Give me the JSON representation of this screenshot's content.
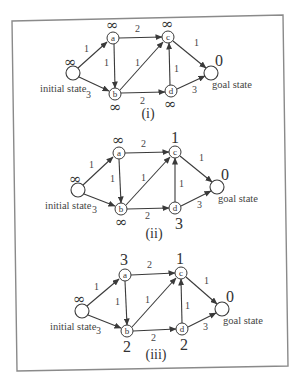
{
  "figure": {
    "labels": {
      "initial_state": "initial state",
      "goal_state": "goal state"
    },
    "panels": [
      {
        "caption": "(i)",
        "values": {
          "start": "∞",
          "a": "∞",
          "b": "∞",
          "c": "∞",
          "d": "∞",
          "goal": "0"
        }
      },
      {
        "caption": "(ii)",
        "values": {
          "start": "∞",
          "a": "∞",
          "b": "∞",
          "c": "1",
          "d": "3",
          "goal": "0"
        }
      },
      {
        "caption": "(iii)",
        "values": {
          "start": "∞",
          "a": "3",
          "b": "2",
          "c": "1",
          "d": "2",
          "goal": "0"
        }
      }
    ],
    "nodes": [
      "a",
      "b",
      "c",
      "d"
    ],
    "edges": [
      {
        "from": "start",
        "to": "a",
        "weight": "1"
      },
      {
        "from": "start",
        "to": "b",
        "weight": "3"
      },
      {
        "from": "a",
        "to": "b",
        "weight": "1"
      },
      {
        "from": "a",
        "to": "c",
        "weight": "2"
      },
      {
        "from": "b",
        "to": "c",
        "weight": "1"
      },
      {
        "from": "b",
        "to": "d",
        "weight": "2"
      },
      {
        "from": "d",
        "to": "c",
        "weight": "1"
      },
      {
        "from": "c",
        "to": "goal",
        "weight": "1"
      },
      {
        "from": "d",
        "to": "goal",
        "weight": "3"
      }
    ]
  }
}
